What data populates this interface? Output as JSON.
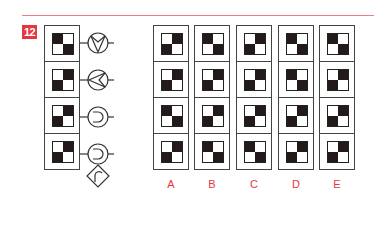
{
  "puzzle": {
    "number": "12",
    "colors": {
      "accent": "#e5373f",
      "rule": "#ef7e84",
      "ink": "#231a1a"
    },
    "question_column": {
      "cells": [
        {
          "pattern": [
            "b",
            "w",
            "w",
            "b"
          ],
          "symbol": "circle-v-down-icon"
        },
        {
          "pattern": [
            "w",
            "b",
            "b",
            "w"
          ],
          "symbol": "circle-v-left-icon"
        },
        {
          "pattern": [
            "w",
            "b",
            "b",
            "w"
          ],
          "symbol": "circle-cup-left-icon"
        },
        {
          "pattern": [
            "w",
            "b",
            "b",
            "w"
          ],
          "symbol": "circle-cup-left-with-diamond-arch-icon"
        }
      ]
    },
    "options": [
      {
        "label": "A",
        "cells": [
          [
            "w",
            "b",
            "b",
            "w"
          ],
          [
            "w",
            "b",
            "b",
            "w"
          ],
          [
            "b",
            "w",
            "w",
            "b"
          ],
          [
            "w",
            "b",
            "b",
            "w"
          ]
        ]
      },
      {
        "label": "B",
        "cells": [
          [
            "b",
            "w",
            "w",
            "b"
          ],
          [
            "w",
            "b",
            "b",
            "w"
          ],
          [
            "w",
            "b",
            "b",
            "w"
          ],
          [
            "b",
            "w",
            "w",
            "b"
          ]
        ]
      },
      {
        "label": "C",
        "cells": [
          [
            "w",
            "b",
            "b",
            "w"
          ],
          [
            "w",
            "b",
            "b",
            "w"
          ],
          [
            "w",
            "b",
            "b",
            "w"
          ],
          [
            "b",
            "w",
            "w",
            "b"
          ]
        ]
      },
      {
        "label": "D",
        "cells": [
          [
            "b",
            "w",
            "w",
            "b"
          ],
          [
            "b",
            "w",
            "w",
            "b"
          ],
          [
            "w",
            "b",
            "b",
            "w"
          ],
          [
            "w",
            "b",
            "b",
            "w"
          ]
        ]
      },
      {
        "label": "E",
        "cells": [
          [
            "b",
            "w",
            "w",
            "b"
          ],
          [
            "w",
            "b",
            "b",
            "w"
          ],
          [
            "w",
            "b",
            "b",
            "w"
          ],
          [
            "w",
            "b",
            "b",
            "w"
          ]
        ]
      }
    ]
  }
}
